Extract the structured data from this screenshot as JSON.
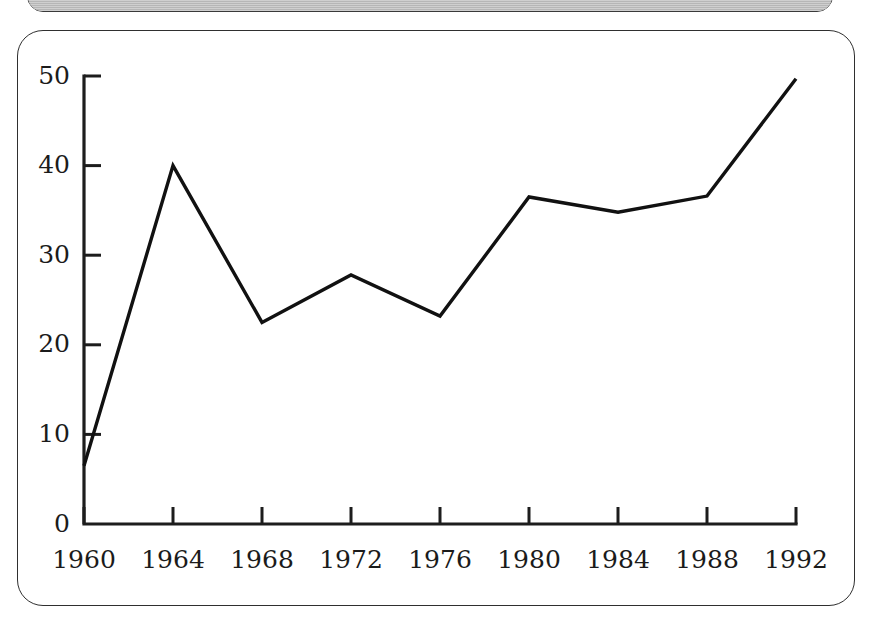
{
  "figure": {
    "frame_style": "rounded-rectangle",
    "background_color": "#ffffff",
    "border_color": "#2f2f2f",
    "line_color": "#111111"
  },
  "top_panel": {
    "name": "grey-banner-strip",
    "color": "#b6b6b6",
    "visible_text": ""
  },
  "chart_data": {
    "type": "line",
    "title": "",
    "subtitle": "",
    "xlabel": "",
    "ylabel": "",
    "x": [
      1960,
      1964,
      1968,
      1972,
      1976,
      1980,
      1984,
      1988,
      1992
    ],
    "values": [
      6.5,
      40.0,
      22.5,
      27.8,
      23.2,
      36.5,
      34.8,
      36.6,
      49.7
    ],
    "series": [
      {
        "name": "series-1",
        "values": [
          6.5,
          40.0,
          22.5,
          27.8,
          23.2,
          36.5,
          34.8,
          36.6,
          49.7
        ]
      }
    ],
    "xlim": [
      1960,
      1992
    ],
    "ylim": [
      0,
      50
    ],
    "xticks": [
      1960,
      1964,
      1968,
      1972,
      1976,
      1980,
      1984,
      1988,
      1992
    ],
    "yticks": [
      0,
      10,
      20,
      30,
      40,
      50
    ],
    "xtick_labels": [
      "1960",
      "1964",
      "1968",
      "1972",
      "1976",
      "1980",
      "1984",
      "1988",
      "1992"
    ],
    "ytick_labels": [
      "0",
      "10",
      "20",
      "30",
      "40",
      "50"
    ],
    "grid": false,
    "legend": null,
    "legend_position": "none",
    "annotations": []
  }
}
